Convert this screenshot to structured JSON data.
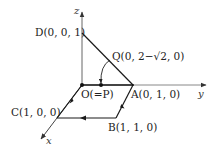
{
  "diagram": {
    "type": "3d-coordinate-path",
    "axes": {
      "x": "x",
      "y": "y",
      "z": "z"
    },
    "points": {
      "O": "O(=P)",
      "A": "A(0, 1, 0)",
      "B": "B(1, 1, 0)",
      "C": "C(1, 0, 0)",
      "D": "D(0, 0, 1)",
      "Q": "Q(0, 2−√2, 0)"
    },
    "path": [
      "D",
      "A",
      "B",
      "C",
      "O"
    ],
    "colors": {
      "line": "#1a1a1a",
      "axis": "#555555",
      "text": "#222222"
    }
  }
}
